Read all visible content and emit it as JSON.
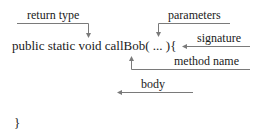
{
  "diagram": {
    "code_line": "public static void callBob( ... ){",
    "closing_brace": "}",
    "annotations": {
      "return_type": "return type",
      "parameters": "parameters",
      "signature": "signature",
      "method_name": "method name",
      "body": "body"
    },
    "colors": {
      "text": "#1a1a1a",
      "line": "#7a7a7a",
      "background": "#ffffff"
    }
  }
}
